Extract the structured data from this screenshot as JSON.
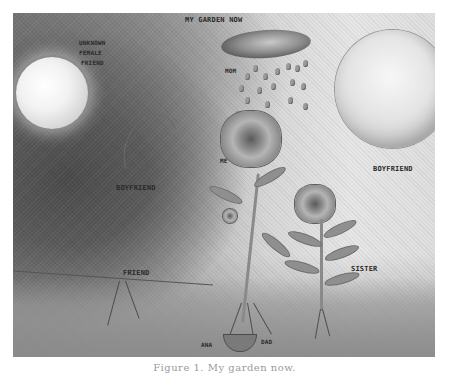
{
  "figure": {
    "type": "hand-drawn pencil illustration",
    "title_label": "MY GARDEN NOW",
    "labels": {
      "unknown_female_friend": [
        "UNKNOWN",
        "FEMALE",
        "FRIEND"
      ],
      "mom": "MOM",
      "me": "ME",
      "boyfriend_right": "BOYFRIEND",
      "boyfriend_left": "BOYFRIEND",
      "friend": "FRIEND",
      "sister": "SISTER",
      "ana": "ANA",
      "dad": "DAD"
    },
    "elements": [
      "sun-left",
      "moon-right",
      "cloud",
      "rain-drops",
      "rose-me",
      "rose-sister",
      "fern-sister",
      "bud",
      "roots",
      "seed-pod",
      "face-profile"
    ]
  },
  "caption": {
    "text": "Figure 1. My garden now."
  }
}
